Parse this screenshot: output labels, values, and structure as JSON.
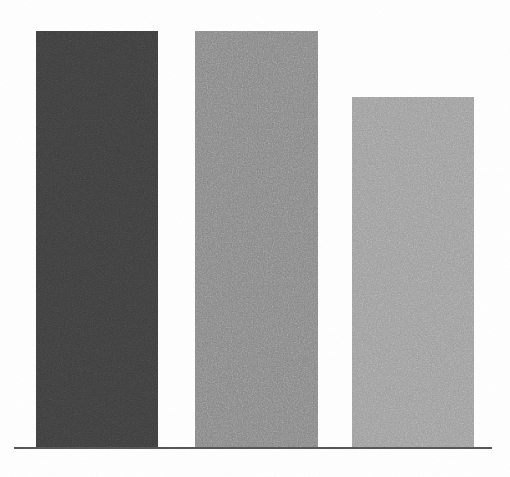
{
  "canvas": {
    "width": 510,
    "height": 477,
    "background_color": "#ffffff"
  },
  "axis": {
    "baseline": {
      "x_start": 14,
      "x_end": 492,
      "y": 447,
      "thickness": 2,
      "color": "#555555"
    },
    "show_ticks": false,
    "show_tick_labels": false,
    "show_gridlines": false
  },
  "chart_data": {
    "type": "bar",
    "title": "",
    "subtitle": "",
    "xlabel": "",
    "ylabel": "",
    "categories": [
      "",
      "",
      ""
    ],
    "values": [
      416,
      416,
      350
    ],
    "value_unit": "px",
    "ylim": [
      0,
      447
    ],
    "grid": false,
    "legend": false,
    "legend_position": "none",
    "annotations": [],
    "tick_labels": {
      "x": [],
      "y": []
    },
    "series": [
      {
        "name": "bars",
        "values": [
          416,
          416,
          350
        ]
      }
    ],
    "bars": [
      {
        "index": 0,
        "label": "",
        "value": 416,
        "x": 36,
        "y": 31,
        "width": 122,
        "height": 416,
        "color": "#3a3a3a"
      },
      {
        "index": 1,
        "label": "",
        "value": 416,
        "x": 195,
        "y": 31,
        "width": 123,
        "height": 416,
        "color": "#838383"
      },
      {
        "index": 2,
        "label": "",
        "value": 350,
        "x": 352,
        "y": 97,
        "width": 122,
        "height": 350,
        "color": "#9b9b9b"
      }
    ],
    "palette": [
      "#3a3a3a",
      "#838383",
      "#9b9b9b"
    ],
    "texture": "film-grain-noise"
  }
}
